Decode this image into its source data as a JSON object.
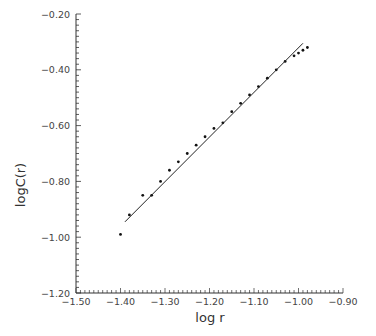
{
  "chart_data": {
    "type": "scatter",
    "title": "",
    "xlabel": "log r",
    "ylabel": "logC(r)",
    "xlim": [
      -1.5,
      -0.9
    ],
    "ylim": [
      -1.2,
      -0.2
    ],
    "x_ticks": [
      "-1.50",
      "-1.40",
      "-1.30",
      "-1.20",
      "-1.10",
      "-1.00",
      "-0.90"
    ],
    "y_ticks": [
      "-0.20",
      "-0.40",
      "-0.60",
      "-0.80",
      "-1.00",
      "-1.20"
    ],
    "grid": false,
    "legend": null,
    "series": [
      {
        "name": "data",
        "type": "scatter",
        "x": [
          -1.4,
          -1.38,
          -1.35,
          -1.33,
          -1.31,
          -1.29,
          -1.27,
          -1.25,
          -1.23,
          -1.21,
          -1.19,
          -1.17,
          -1.15,
          -1.13,
          -1.11,
          -1.09,
          -1.07,
          -1.05,
          -1.03,
          -1.01,
          -1.0,
          -0.99,
          -0.98
        ],
        "y": [
          -0.99,
          -0.92,
          -0.85,
          -0.85,
          -0.8,
          -0.76,
          -0.73,
          -0.7,
          -0.67,
          -0.64,
          -0.61,
          -0.59,
          -0.55,
          -0.52,
          -0.49,
          -0.46,
          -0.43,
          -0.4,
          -0.37,
          -0.35,
          -0.34,
          -0.33,
          -0.32
        ]
      },
      {
        "name": "fit",
        "type": "line",
        "x": [
          -1.39,
          -0.99
        ],
        "y": [
          -0.945,
          -0.305
        ]
      }
    ]
  }
}
